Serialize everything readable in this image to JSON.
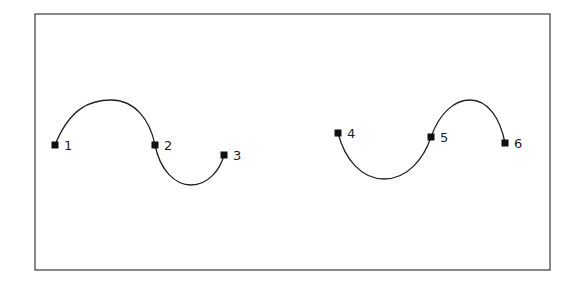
{
  "diagram": {
    "frame": {
      "x": 35,
      "y": 14,
      "width": 515,
      "height": 256,
      "stroke": "#3a3a3a"
    },
    "colors": {
      "curve": "#222222",
      "anchor": "#111111",
      "label": "#222222",
      "background": "#ffffff"
    },
    "anchors": [
      {
        "id": "1",
        "label": "1",
        "x": 55,
        "y": 145
      },
      {
        "id": "2",
        "label": "2",
        "x": 155,
        "y": 145
      },
      {
        "id": "3",
        "label": "3",
        "x": 224,
        "y": 155
      },
      {
        "id": "4",
        "label": "4",
        "x": 338,
        "y": 133
      },
      {
        "id": "5",
        "label": "5",
        "x": 431,
        "y": 137
      },
      {
        "id": "6",
        "label": "6",
        "x": 505,
        "y": 143
      }
    ],
    "paths": [
      {
        "name": "path-left",
        "d": "M55,145 C70,108 90,100 111,100 C135,100 150,120 155,145 C160,170 175,185 191,185 C208,185 220,170 224,155"
      },
      {
        "name": "path-right",
        "d": "M338,133 C345,160 362,179 384,179 C408,179 424,158 431,137 C440,112 455,100 470,100 C488,100 500,118 505,143"
      }
    ]
  }
}
